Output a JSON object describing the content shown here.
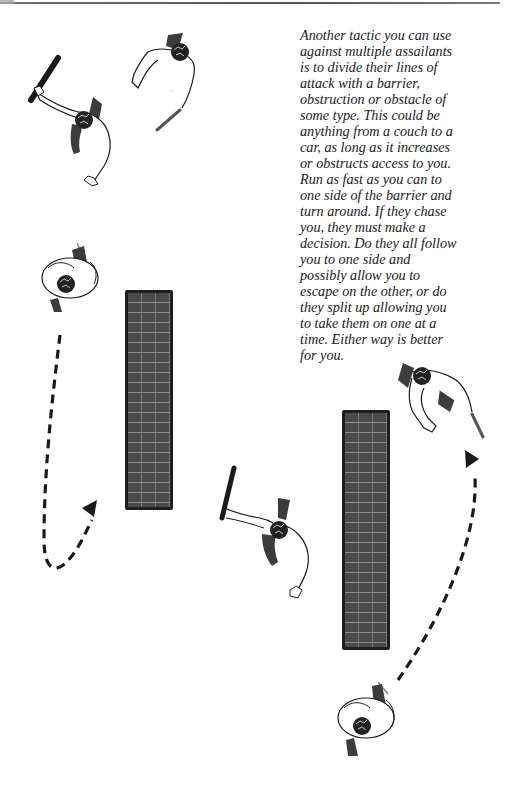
{
  "page": {
    "type": "book-page-illustration",
    "top_rule": true
  },
  "text": {
    "lines": [
      "Another tactic you can use",
      "against multiple assailants",
      "is to divide their lines of",
      "attack with a barrier,",
      "obstruction or obstacle of",
      "some type. This could be",
      "anything from a couch to a",
      "car, as long as it increases",
      "or obstructs access to you.",
      "Run as fast as you can to",
      "one side of the barrier and",
      "turn around. If they chase",
      "you, they must make a",
      "decision. Do they all follow",
      "you to one side and",
      "possibly allow you to",
      "escape on the other, or do",
      "they split up allowing you",
      "to take them on one at a",
      "time. Either way is better",
      "for you."
    ]
  },
  "illustrations": {
    "scene_1": {
      "attacker_baton": "attacker with baton, top-down view",
      "attacker_knife": "attacker with knife, top-down view",
      "defender": "defender, top-down view",
      "barrier": "brick wall barrier",
      "path": "dashed arrow running around barrier"
    },
    "scene_2": {
      "attacker_baton": "attacker with baton, top-down view",
      "attacker_knife": "attacker with knife, top-down view",
      "defender": "defender, top-down view",
      "barrier": "brick wall barrier",
      "path": "dashed arrow running around barrier"
    }
  },
  "colors": {
    "ink": "#1a1a1a",
    "barrier_fill": "#4a4a4a",
    "barrier_mortar": "#8a8a8a",
    "shadow": "#3c3c3c"
  }
}
